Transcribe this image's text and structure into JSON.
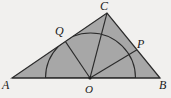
{
  "figure": {
    "labels": {
      "A": "A",
      "B": "B",
      "C": "C",
      "O": "O",
      "P": "P",
      "Q": "Q"
    },
    "colors": {
      "paper": "#f1f0ee",
      "triangle_shade": "#a7a7a7",
      "semicircle_shade": "#d8d8d8",
      "line": "#2b2b2b",
      "label_text": "#1a1a1a"
    }
  }
}
